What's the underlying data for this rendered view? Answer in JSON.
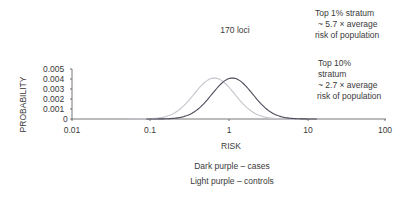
{
  "chart_data": {
    "type": "line",
    "title": "170 loci",
    "xlabel": "RISK",
    "ylabel": "PROBABILITY",
    "x_scale": "log",
    "xlim": [
      0.01,
      100
    ],
    "ylim": [
      0,
      0.005
    ],
    "x_ticks": [
      "0.01",
      "0.1",
      "1",
      "10",
      "100"
    ],
    "y_ticks": [
      "0",
      "0.001",
      "0.002",
      "0.003",
      "0.004",
      "0.005"
    ],
    "grid": false,
    "series": [
      {
        "name": "Dark purple – cases",
        "color": "#4a4a5a",
        "distribution": "lognormal",
        "peak_x": 1.12,
        "peak_y": 0.0041,
        "approx_range": [
          0.15,
          7
        ]
      },
      {
        "name": "Light purple – controls",
        "color": "#c4c4cc",
        "distribution": "lognormal",
        "peak_x": 0.66,
        "peak_y": 0.0041,
        "approx_range": [
          0.1,
          5
        ]
      }
    ],
    "annotations": [
      "Top 1% stratum ~ 5.7 × average risk of population",
      "Top 10% stratum ~ 2.7 × average risk of population"
    ],
    "legend": [
      "Dark purple – cases",
      "Light purple – controls"
    ]
  },
  "labels": {
    "title": "170 loci",
    "xlabel": "RISK",
    "ylabel": "PROBABILITY",
    "x_ticks": [
      "0.01",
      "0.1",
      "1",
      "10",
      "100"
    ],
    "y_ticks": [
      "0.005",
      "0.004",
      "0.003",
      "0.002",
      "0.001",
      "0"
    ],
    "annotation_top1": [
      "Top 1% stratum",
      "~ 5.7 × average",
      "risk of population"
    ],
    "annotation_top10": [
      "Top 10%",
      "stratum",
      "~ 2.7 × average",
      "risk of population"
    ],
    "legend_cases": "Dark purple – cases",
    "legend_controls": "Light purple – controls"
  }
}
